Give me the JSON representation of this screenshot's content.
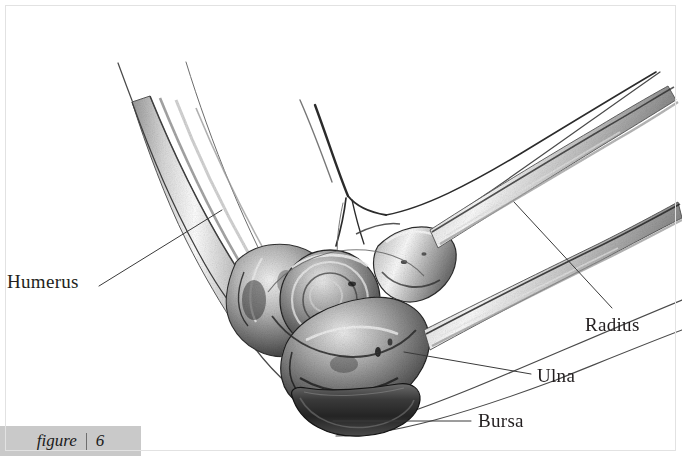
{
  "figure": {
    "caption_word": "figure",
    "caption_number": "6",
    "style": "pen-and-ink stipple medical illustration",
    "background_color": "#ffffff",
    "caption_band_color": "#c9c9c9",
    "frame_color": "#e2e2e2",
    "ink_color": "#231f20"
  },
  "labels": [
    {
      "id": "humerus",
      "text": "Humerus",
      "x": 7,
      "y": 272,
      "side": "left"
    },
    {
      "id": "radius",
      "text": "Radius",
      "x": 585,
      "y": 315,
      "side": "right"
    },
    {
      "id": "ulna",
      "text": "Ulna",
      "x": 537,
      "y": 366,
      "side": "right"
    },
    {
      "id": "bursa",
      "text": "Bursa",
      "x": 478,
      "y": 411,
      "side": "right"
    }
  ],
  "leader_lines": [
    {
      "id": "humerus-leader",
      "from": [
        99,
        286
      ],
      "to": [
        222,
        210
      ]
    },
    {
      "id": "radius-leader",
      "from": [
        514,
        202
      ],
      "to": [
        612,
        308
      ]
    },
    {
      "id": "ulna-leader",
      "from": [
        404,
        352
      ],
      "to": [
        531,
        374
      ]
    },
    {
      "id": "bursa-leader",
      "from": [
        333,
        421
      ],
      "to": [
        471,
        421
      ]
    }
  ],
  "anatomy_parts": [
    {
      "id": "humerus",
      "name": "Humerus",
      "description": "upper arm bone shaft descending from upper left"
    },
    {
      "id": "radius",
      "name": "Radius",
      "description": "lateral forearm bone running to upper right"
    },
    {
      "id": "ulna",
      "name": "Ulna",
      "description": "medial forearm bone with olecranon process"
    },
    {
      "id": "bursa",
      "name": "Bursa",
      "description": "dark crescent-shaped olecranon bursa sac at elbow tip"
    }
  ]
}
